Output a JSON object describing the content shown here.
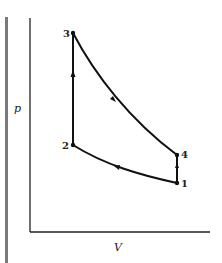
{
  "diagram": {
    "title": "",
    "type": "p-V cycle diagram",
    "axes": {
      "y_label": "p",
      "x_label": "V"
    },
    "points": [
      {
        "id": "1",
        "label": "1"
      },
      {
        "id": "2",
        "label": "2"
      },
      {
        "id": "3",
        "label": "3"
      },
      {
        "id": "4",
        "label": "4"
      }
    ],
    "processes": [
      {
        "from": "1",
        "to": "2",
        "shape": "curve",
        "direction": "left"
      },
      {
        "from": "2",
        "to": "3",
        "shape": "vertical line",
        "direction": "up"
      },
      {
        "from": "3",
        "to": "4",
        "shape": "curve",
        "direction": "down-right"
      },
      {
        "from": "4",
        "to": "1",
        "shape": "vertical line",
        "direction": "down"
      }
    ],
    "colors": {
      "line": "#111111",
      "page_bar": "#7a7a7a",
      "background": "#ffffff"
    }
  }
}
